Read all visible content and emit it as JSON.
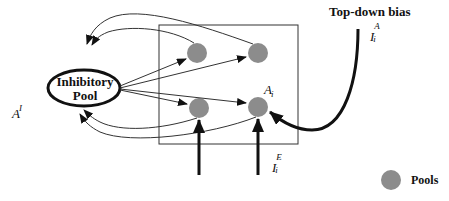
{
  "diagram": {
    "header_faint_text": "",
    "inhibitory_pool": {
      "line1": "Inhibitory",
      "line2": "Pool",
      "label_base": "A",
      "label_sup": "I"
    },
    "pool_group": {
      "pool_label_base": "A",
      "pool_label_sub": "i",
      "nodes": [
        "pool-top-left",
        "pool-top-right",
        "pool-bottom-left",
        "pool-bottom-right"
      ]
    },
    "top_down": {
      "title": "Top-down bias",
      "label_base": "I",
      "label_sub": "i",
      "label_sup": "A"
    },
    "external_input": {
      "label_base": "I",
      "label_sub": "i",
      "label_sup": "E"
    },
    "legend": {
      "label": "Pools",
      "color": "#8c8c8c"
    },
    "colors": {
      "pool_fill": "#8c8c8c",
      "line": "#222222",
      "box": "#333333"
    }
  }
}
